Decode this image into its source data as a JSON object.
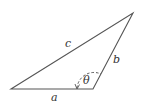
{
  "diagram": {
    "type": "triangle",
    "stroke_color": "#555555",
    "vertices": {
      "left": [
        11,
        89
      ],
      "bottom_right": [
        93,
        89
      ],
      "top": [
        133,
        13
      ]
    },
    "sides": [
      {
        "label": "a",
        "between": [
          "left",
          "bottom_right"
        ]
      },
      {
        "label": "b",
        "between": [
          "bottom_right",
          "top"
        ]
      },
      {
        "label": "c",
        "between": [
          "left",
          "top"
        ]
      }
    ],
    "angle": {
      "label": "θ",
      "at": "bottom_right",
      "style": "dashed arc with arrow"
    }
  }
}
